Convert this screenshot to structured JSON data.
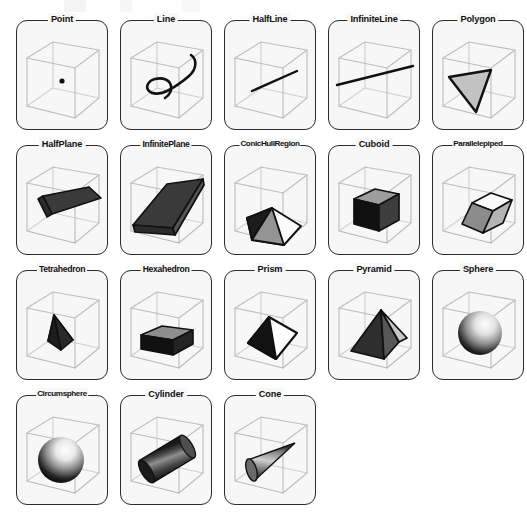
{
  "figure": {
    "kind": "geometric-region-primitive-gallery",
    "columns": 5,
    "rows": 4,
    "card_count": 18,
    "background_color": "#ffffff",
    "card_fill_color": "#f7f7f7",
    "card_border_color": "#2b2b2b",
    "wireframe_color": "#b9b9b9",
    "shape_dark_color": "#1a1a1a",
    "shape_mid_color": "#8d8d8d",
    "shape_light_color": "#d9d9d9"
  },
  "cards": [
    {
      "id": "point",
      "label": "Point",
      "row": 1,
      "col": 1
    },
    {
      "id": "line",
      "label": "Line",
      "row": 1,
      "col": 2
    },
    {
      "id": "halfline",
      "label": "HalfLine",
      "row": 1,
      "col": 3
    },
    {
      "id": "infiniteline",
      "label": "InfiniteLine",
      "row": 1,
      "col": 4
    },
    {
      "id": "polygon",
      "label": "Polygon",
      "row": 1,
      "col": 5
    },
    {
      "id": "halfplane",
      "label": "HalfPlane",
      "row": 2,
      "col": 1
    },
    {
      "id": "infiniteplane",
      "label": "InfinitePlane",
      "row": 2,
      "col": 2
    },
    {
      "id": "conichullregion",
      "label": "ConicHullRegion",
      "row": 2,
      "col": 3
    },
    {
      "id": "cuboid",
      "label": "Cuboid",
      "row": 2,
      "col": 4
    },
    {
      "id": "parallelepiped",
      "label": "Parallelepiped",
      "row": 2,
      "col": 5
    },
    {
      "id": "tetrahedron",
      "label": "Tetrahedron",
      "row": 3,
      "col": 1
    },
    {
      "id": "hexahedron",
      "label": "Hexahedron",
      "row": 3,
      "col": 2
    },
    {
      "id": "prism",
      "label": "Prism",
      "row": 3,
      "col": 3
    },
    {
      "id": "pyramid",
      "label": "Pyramid",
      "row": 3,
      "col": 4
    },
    {
      "id": "sphere",
      "label": "Sphere",
      "row": 3,
      "col": 5
    },
    {
      "id": "circumsphere",
      "label": "Circumsphere",
      "row": 4,
      "col": 1
    },
    {
      "id": "cylinder",
      "label": "Cylinder",
      "row": 4,
      "col": 2
    },
    {
      "id": "cone",
      "label": "Cone",
      "row": 4,
      "col": 3
    }
  ]
}
